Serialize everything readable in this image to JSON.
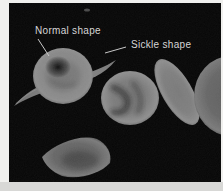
{
  "figure": {
    "annotations": {
      "normal_label": "Normal shape",
      "sickle_label": "Sickle shape"
    },
    "colors": {
      "field_background": "#060606",
      "frame": "#f0f0ee",
      "frame_bottom": "#d8d8d6",
      "label_text": "#d6d6d6",
      "leader_line": "#c8c8c8",
      "cell_gray": "#7d7d7d"
    },
    "cells": [
      {
        "id": "normal-red-blood-cell",
        "shape": "round biconcave disc with dark central depression"
      },
      {
        "id": "long-sickle-cell",
        "shape": "long tapered crescent passing behind normal cell"
      },
      {
        "id": "wrinkled-red-blood-cell",
        "shape": "round cell with dark surface folds"
      },
      {
        "id": "oval-sickle-cell",
        "shape": "elongated tilted oval"
      },
      {
        "id": "partial-cell-right-edge",
        "shape": "round cell clipped by right edge"
      },
      {
        "id": "bottom-sickle-cell",
        "shape": "pointed leaf-shaped cell"
      }
    ]
  }
}
